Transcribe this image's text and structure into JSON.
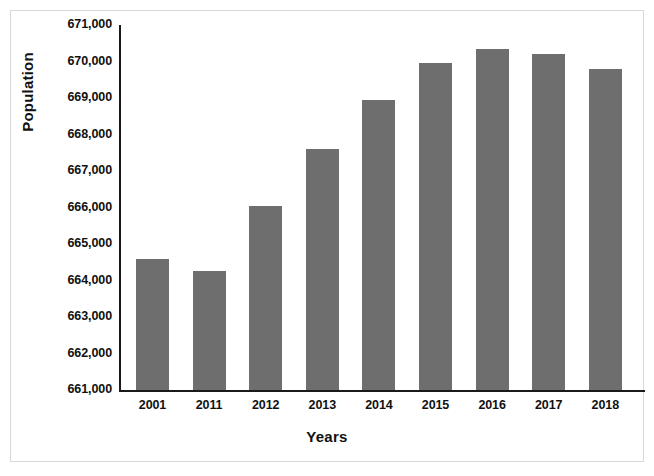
{
  "chart_data": {
    "type": "bar",
    "title": "",
    "xlabel": "Years",
    "ylabel": "Population",
    "categories": [
      "2001",
      "2011",
      "2012",
      "2013",
      "2014",
      "2015",
      "2016",
      "2017",
      "2018"
    ],
    "values": [
      664600,
      664250,
      666050,
      667600,
      668950,
      669950,
      670350,
      670200,
      669800
    ],
    "ylim": [
      661000,
      671000
    ],
    "ytick_labels": [
      "671,000",
      "670,000",
      "669,000",
      "668,000",
      "667,000",
      "666,000",
      "665,000",
      "664,000",
      "663,000",
      "662,000",
      "661,000"
    ],
    "ytick_values": [
      671000,
      670000,
      669000,
      668000,
      667000,
      666000,
      665000,
      664000,
      663000,
      662000,
      661000
    ],
    "grid": false,
    "legend": null,
    "bar_color": "#6e6e6e",
    "axis_color": "#1a1a1a",
    "background_color": "#ffffff",
    "frame_color": "#d9d9d9"
  }
}
